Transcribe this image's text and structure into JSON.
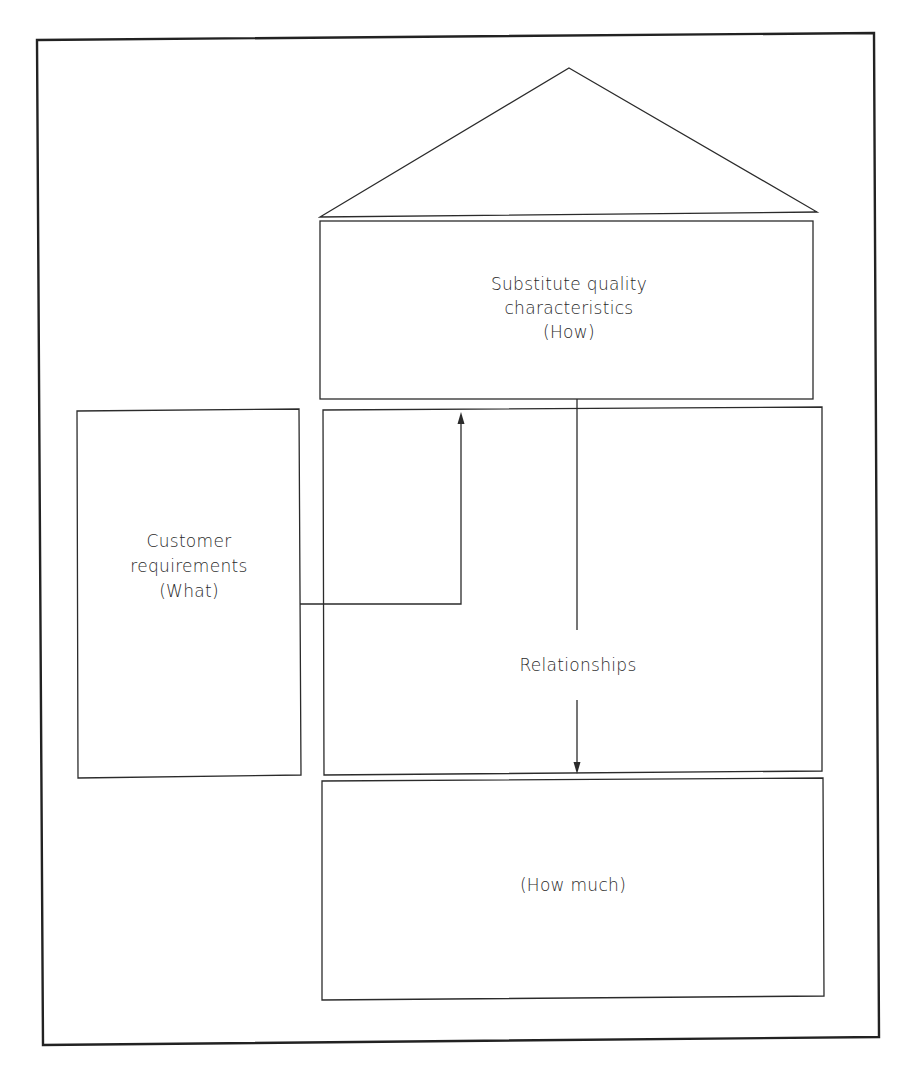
{
  "diagram": {
    "roof": {
      "label": ""
    },
    "how_box": {
      "lines": [
        "Substitute quality",
        "characteristics",
        "(How)"
      ]
    },
    "what_box": {
      "lines": [
        "Customer",
        "requirements",
        "(What)"
      ]
    },
    "relationships_box": {
      "label": "Relationships"
    },
    "how_much_box": {
      "label": "(How much)"
    },
    "connectors": [
      {
        "from": "what_box",
        "to": "how_box",
        "direction": "up"
      },
      {
        "from": "how_box",
        "to": "how_much_box",
        "direction": "down",
        "via": "relationships_box"
      }
    ],
    "colors": {
      "line": "#2b2b2b",
      "text": "#2a2a2a",
      "background": "#ffffff"
    }
  }
}
